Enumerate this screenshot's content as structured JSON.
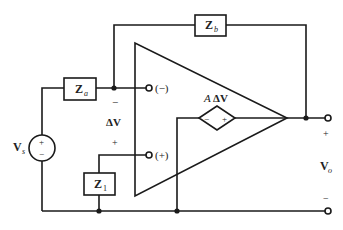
{
  "diagram": {
    "type": "circuit-schematic",
    "components": {
      "source": {
        "label": "V",
        "subscript": "s",
        "plus": "+",
        "minus": "−"
      },
      "za": {
        "label": "Z",
        "subscript": "a"
      },
      "zb": {
        "label": "Z",
        "subscript": "b"
      },
      "z1": {
        "label": "Z",
        "subscript": "1"
      },
      "opamp": {
        "inverting_label": "(−)",
        "noninverting_label": "(+)",
        "dependent_source": {
          "label_prefix": "A",
          "label": "ΔV",
          "minus": "−",
          "plus": "+"
        }
      }
    },
    "input_voltage": {
      "label": "ΔV",
      "top_sign": "−",
      "bottom_sign": "+"
    },
    "output_voltage": {
      "label": "V",
      "subscript": "o",
      "top_sign": "+",
      "bottom_sign": "−"
    }
  }
}
